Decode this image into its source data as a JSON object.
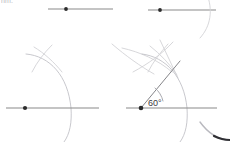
{
  "canvas": {
    "width": 230,
    "height": 142,
    "background": "#ffffff",
    "partial_caption": "nm."
  },
  "colors": {
    "baseline": "#8a8a8a",
    "construction_arc": "#d2d2d6",
    "ray": "#77777c",
    "vertex_dot": "#2b2b2b",
    "angle_label": "#3a3a3e",
    "corner_mark": "#2f2f33"
  },
  "panels": [
    {
      "id": "step-1",
      "name": "draw-baseline-with-vertex",
      "caption": "",
      "baseline": {
        "x1": 48,
        "y1": 9,
        "x2": 113,
        "y2": 9
      },
      "vertex": {
        "cx": 66,
        "cy": 9,
        "r": 1.9
      },
      "arcs": []
    },
    {
      "id": "step-2",
      "name": "draw-first-compass-arc",
      "caption": "",
      "baseline": {
        "x1": 148,
        "y1": 10,
        "x2": 216,
        "y2": 10
      },
      "vertex": {
        "cx": 160,
        "cy": 10,
        "r": 1.9
      },
      "arcs": [
        "wide-arc-from-vertex"
      ]
    },
    {
      "id": "step-3",
      "name": "draw-intersecting-arc",
      "caption": "",
      "baseline": {
        "x1": 6,
        "y1": 108,
        "x2": 99,
        "y2": 108
      },
      "vertex": {
        "cx": 25,
        "cy": 108,
        "r": 2.1
      },
      "arcs": [
        "radius-arc",
        "crossing-arc"
      ]
    },
    {
      "id": "step-4",
      "name": "draw-ray-and-label-angle",
      "caption": "",
      "baseline": {
        "x1": 126,
        "y1": 108,
        "x2": 217,
        "y2": 108
      },
      "vertex": {
        "cx": 141,
        "cy": 108,
        "r": 2.2
      },
      "arcs": [
        "radius-arc",
        "crossing-arc"
      ],
      "ray": {
        "x1": 141,
        "y1": 108,
        "x2": 178,
        "y2": 64
      },
      "angle": {
        "value": "60",
        "unit": "°",
        "label": "60°",
        "label_x": 149,
        "label_y": 106
      }
    }
  ],
  "decorations": [
    {
      "name": "corner-swoosh-bottom-right",
      "color": "#2f2f33"
    },
    {
      "name": "faint-arc-top-right",
      "color": "#d2d2d6"
    },
    {
      "name": "faint-arc-center",
      "color": "#d2d2d6"
    }
  ]
}
